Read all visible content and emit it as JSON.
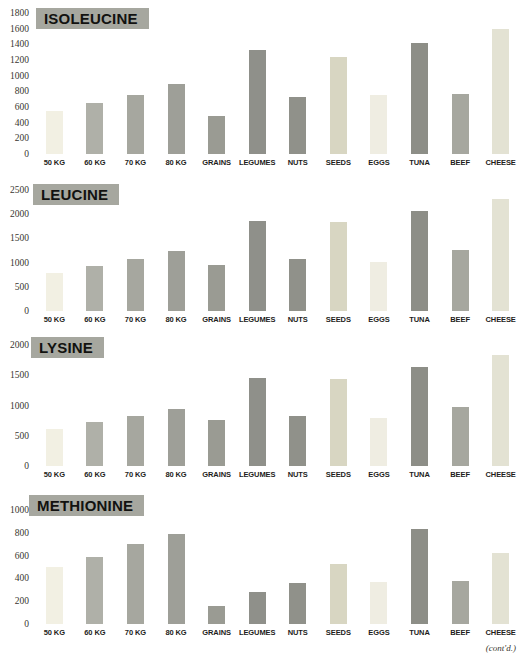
{
  "page": {
    "contd_note": "(cont'd.)"
  },
  "palette": {
    "background": "#ffffff",
    "title_badge_bg": "#a6a79f",
    "title_text": "#121210",
    "axis_text": "#38362f",
    "category_label_text": "#1d1d1b",
    "bar_colors": {
      "50 KG": "#f2f0e3",
      "60 KG": "#afb0a8",
      "70 KG": "#a6a79f",
      "80 KG": "#9e9f98",
      "GRAINS": "#9a9b93",
      "LEGUMES": "#8f908a",
      "NUTS": "#90918a",
      "SEEDS": "#d8d6c2",
      "EGGS": "#efede2",
      "TUNA": "#8d8e87",
      "BEEF": "#a6a79f",
      "CHEESE": "#e3e2d3"
    }
  },
  "chart_data": [
    {
      "type": "bar",
      "title": "ISOLEUCINE",
      "categories": [
        "50 KG",
        "60 KG",
        "70 KG",
        "80 KG",
        "GRAINS",
        "LEGUMES",
        "NUTS",
        "SEEDS",
        "EGGS",
        "TUNA",
        "BEEF",
        "CHEESE"
      ],
      "values": [
        550,
        650,
        750,
        900,
        480,
        1330,
        730,
        1240,
        750,
        1420,
        770,
        1600
      ],
      "ylim": [
        0,
        1800
      ],
      "yticks": [
        0,
        200,
        400,
        600,
        800,
        1000,
        1200,
        1400,
        1600,
        1800
      ],
      "xlabel": "",
      "ylabel": "",
      "grid": false,
      "legend": "none"
    },
    {
      "type": "bar",
      "title": "LEUCINE",
      "categories": [
        "50 KG",
        "60 KG",
        "70 KG",
        "80 KG",
        "GRAINS",
        "LEGUMES",
        "NUTS",
        "SEEDS",
        "EGGS",
        "TUNA",
        "BEEF",
        "CHEESE"
      ],
      "values": [
        780,
        930,
        1070,
        1240,
        960,
        1870,
        1070,
        1840,
        1020,
        2070,
        1260,
        2310
      ],
      "ylim": [
        0,
        2500
      ],
      "yticks": [
        0,
        500,
        1000,
        1500,
        2000,
        2500
      ],
      "xlabel": "",
      "ylabel": "",
      "grid": false,
      "legend": "none"
    },
    {
      "type": "bar",
      "title": "LYSINE",
      "categories": [
        "50 KG",
        "60 KG",
        "70 KG",
        "80 KG",
        "GRAINS",
        "LEGUMES",
        "NUTS",
        "SEEDS",
        "EGGS",
        "TUNA",
        "BEEF",
        "CHEESE"
      ],
      "values": [
        610,
        720,
        830,
        950,
        760,
        1460,
        830,
        1440,
        800,
        1640,
        970,
        1840
      ],
      "ylim": [
        0,
        2000
      ],
      "yticks": [
        0,
        500,
        1000,
        1500,
        2000
      ],
      "xlabel": "",
      "ylabel": "",
      "grid": false,
      "legend": "none"
    },
    {
      "type": "bar",
      "title": "METHIONINE",
      "categories": [
        "50 KG",
        "60 KG",
        "70 KG",
        "80 KG",
        "GRAINS",
        "LEGUMES",
        "NUTS",
        "SEEDS",
        "EGGS",
        "TUNA",
        "BEEF",
        "CHEESE"
      ],
      "values": [
        500,
        590,
        700,
        790,
        160,
        280,
        360,
        530,
        370,
        830,
        380,
        620
      ],
      "ylim": [
        0,
        1000
      ],
      "yticks": [
        0,
        200,
        400,
        600,
        800,
        1000
      ],
      "xlabel": "",
      "ylabel": "",
      "grid": false,
      "legend": "none"
    }
  ]
}
